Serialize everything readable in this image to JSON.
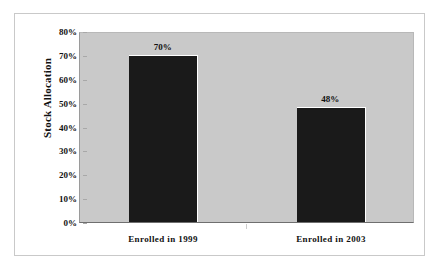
{
  "chart_data": {
    "type": "bar",
    "title": "",
    "subtitle": "",
    "xlabel": "",
    "ylabel": "Stock Allocation",
    "categories": [
      "Enrolled in 1999",
      "Enrolled in 2003"
    ],
    "values": [
      70,
      48
    ],
    "data_labels": [
      "70%",
      "48%"
    ],
    "ylim": [
      0,
      80
    ],
    "ytick_values": [
      80,
      70,
      60,
      50,
      40,
      30,
      20,
      10,
      0
    ],
    "ytick_labels": [
      "80%",
      "70%",
      "60%",
      "50%",
      "40%",
      "30%",
      "20%",
      "10%",
      "0%"
    ],
    "grid": false,
    "legend": null,
    "legend_position": "none",
    "colors": {
      "bar": "#1a1a1a",
      "plot_background": "#c9c9c9",
      "frame_border": "#c9c9c9",
      "text": "#111111",
      "axis_line": "#6f6f6f"
    }
  }
}
